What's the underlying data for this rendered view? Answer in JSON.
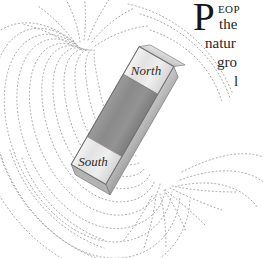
{
  "page": {
    "background_color": "#ffffff",
    "width": 263,
    "height": 258
  },
  "illustration": {
    "name": "bar-magnet-field-diagram",
    "description": "Bar magnet with magnetic field lines",
    "magnet": {
      "north_label": "North",
      "south_label": "South",
      "body_color": "#8c8c8c",
      "pole_color": "#e8e8e8",
      "edge_color": "#b4b4b4",
      "outline_color": "#6f6f6f",
      "tilt_degrees": 28
    },
    "field_lines": {
      "style": "dotted",
      "color": "#a9a9a9",
      "count": 18
    }
  },
  "text": {
    "dropcap": "P",
    "smallcaps": "EOP",
    "line2": "the",
    "line3": "natur",
    "line4": "gro",
    "line5": "l"
  }
}
